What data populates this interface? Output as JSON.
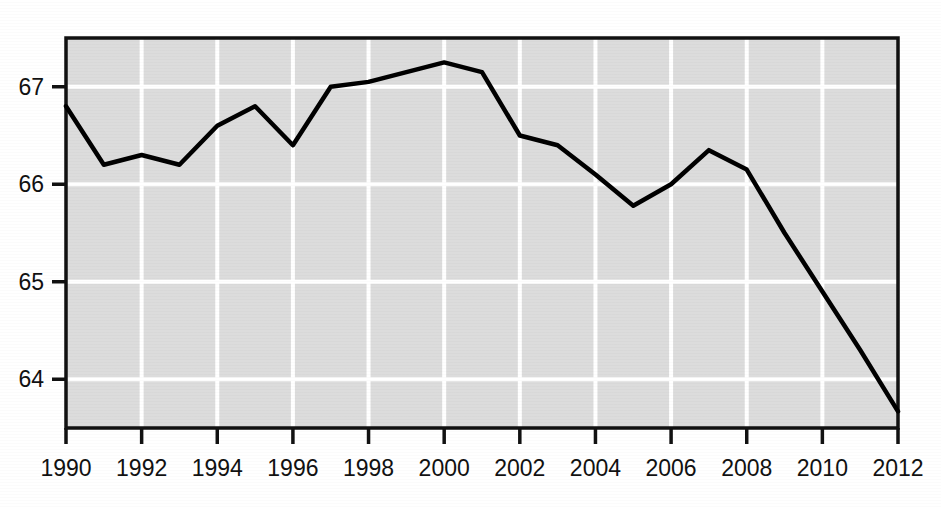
{
  "chart_data": {
    "type": "line",
    "title": "",
    "subtitle": "",
    "xlabel": "",
    "ylabel": "",
    "x": [
      1990,
      1991,
      1992,
      1993,
      1994,
      1995,
      1996,
      1997,
      1998,
      1999,
      2000,
      2001,
      2002,
      2003,
      2004,
      2005,
      2006,
      2007,
      2008,
      2009,
      2010,
      2011,
      2012
    ],
    "values": [
      66.8,
      66.2,
      66.3,
      66.2,
      66.6,
      66.8,
      66.4,
      67.0,
      67.05,
      67.15,
      67.25,
      67.15,
      66.5,
      66.4,
      66.1,
      65.78,
      66.0,
      66.35,
      66.15,
      65.5,
      64.9,
      64.3,
      63.67
    ],
    "series": [
      {
        "name": "",
        "values": [
          66.8,
          66.2,
          66.3,
          66.2,
          66.6,
          66.8,
          66.4,
          67.0,
          67.05,
          67.15,
          67.25,
          67.15,
          66.5,
          66.4,
          66.1,
          65.78,
          66.0,
          66.35,
          66.15,
          65.5,
          64.9,
          64.3,
          63.67
        ]
      }
    ],
    "xlim": [
      1990,
      2012
    ],
    "ylim": [
      63.5,
      67.5
    ],
    "x_ticks": [
      1990,
      1992,
      1994,
      1996,
      1998,
      2000,
      2002,
      2004,
      2006,
      2008,
      2010,
      2012
    ],
    "x_tick_labels": [
      "1990",
      "1992",
      "1994",
      "1996",
      "1998",
      "2000",
      "2002",
      "2004",
      "2006",
      "2008",
      "2010",
      "2012"
    ],
    "y_ticks": [
      64,
      65,
      66,
      67
    ],
    "y_tick_labels": [
      "64",
      "65",
      "66",
      "67"
    ],
    "grid": true,
    "grid_color": "#ffffff",
    "plot_background": "#dcdcdc",
    "line_color": "#000000",
    "legend": null,
    "legend_position": "none",
    "annotations": []
  },
  "axis": {
    "y_labels": [
      "67",
      "66",
      "65",
      "64"
    ],
    "x_labels": [
      "1990",
      "1992",
      "1994",
      "1996",
      "1998",
      "2000",
      "2002",
      "2004",
      "2006",
      "2008",
      "2010",
      "2012"
    ]
  }
}
